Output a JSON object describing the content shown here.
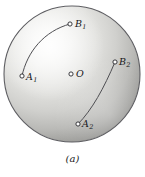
{
  "figure": {
    "caption": "(a)",
    "kind": "sphere-with-geodesics",
    "background_color": "#ffffff",
    "sphere": {
      "name": "shaded-sphere",
      "center_x": 72,
      "center_y": 74,
      "radius": 68,
      "outline_color": "#5a5a5e",
      "highlight_color": "#f2f2f0",
      "mid_color": "#d2d2cf",
      "shadow_color": "#8e8e8c",
      "highlight_x": 44,
      "highlight_y": 40
    },
    "points": [
      {
        "id": "B1",
        "label": "B",
        "subscript": "1",
        "marker_x": 70,
        "marker_y": 24,
        "label_x": 75,
        "label_y": 19
      },
      {
        "id": "A1",
        "label": "A",
        "subscript": "1",
        "marker_x": 22,
        "marker_y": 76,
        "label_x": 26,
        "label_y": 72
      },
      {
        "id": "O",
        "label": "O",
        "subscript": "",
        "marker_x": 71,
        "marker_y": 74,
        "label_x": 76,
        "label_y": 69
      },
      {
        "id": "B2",
        "label": "B",
        "subscript": "2",
        "marker_x": 115,
        "marker_y": 62,
        "label_x": 119,
        "label_y": 57
      },
      {
        "id": "A2",
        "label": "A",
        "subscript": "2",
        "marker_x": 78,
        "marker_y": 124,
        "label_x": 82,
        "label_y": 119
      }
    ],
    "arcs": [
      {
        "id": "arc-A1-B1",
        "from": "A1",
        "to": "B1",
        "color": "#4e4e52",
        "width": 1.0,
        "path": "M 22 76 C 27 52 44 31 70 24"
      },
      {
        "id": "arc-A2-B2",
        "from": "A2",
        "to": "B2",
        "color": "#4e4e52",
        "width": 1.0,
        "path": "M 78 124 C 92 110 104 88 115 62"
      }
    ],
    "marker": {
      "radius": 2.1,
      "stroke_color": "#26262a",
      "fill_color": "#ffffff",
      "stroke_width": 0.9
    }
  }
}
